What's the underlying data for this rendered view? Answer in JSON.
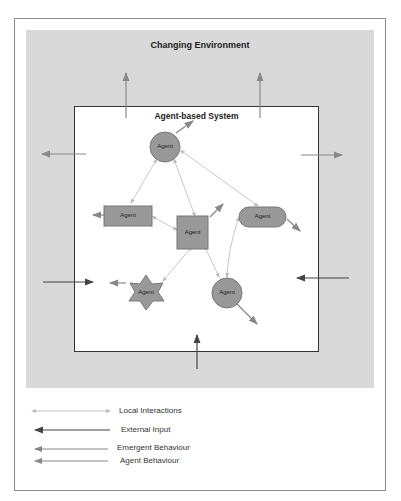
{
  "diagram": {
    "environment_title": "Changing Environment",
    "system_title": "Agent-based System",
    "agents": [
      {
        "shape": "circle",
        "label": "Agent"
      },
      {
        "shape": "rectangle",
        "label": "Agent"
      },
      {
        "shape": "square",
        "label": "Agent"
      },
      {
        "shape": "rounded-rectangle",
        "label": "Agent"
      },
      {
        "shape": "star",
        "label": "Agent"
      },
      {
        "shape": "circle",
        "label": "Agent"
      }
    ]
  },
  "legend": [
    {
      "label": "Local Interactions",
      "style": "light-grey double-headed arrow"
    },
    {
      "label": "External Input",
      "style": "dark arrow"
    },
    {
      "label": "Emergent Behaviour",
      "style": "mid-grey arrow"
    },
    {
      "label": "Agent Behaviour",
      "style": "mid-grey arrow"
    }
  ],
  "colors": {
    "environment": "#d9d9d9",
    "agent_fill": "#999999",
    "local_interaction": "#bdbdbd",
    "external_input": "#444444",
    "emergent": "#8a8a8a"
  }
}
